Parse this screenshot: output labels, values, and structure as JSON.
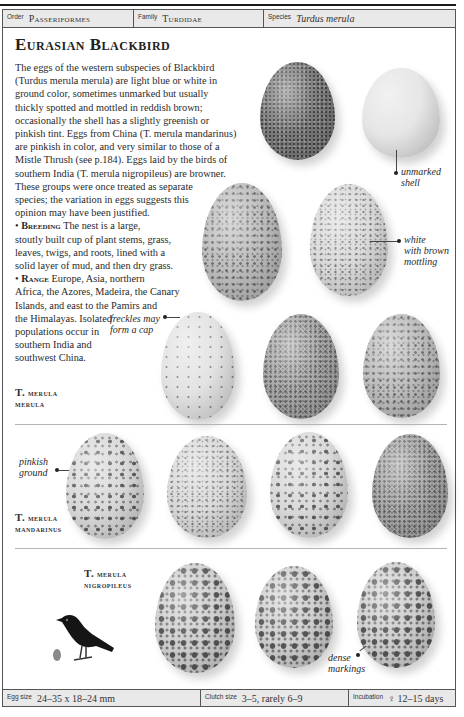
{
  "header": {
    "order_label": "Order",
    "order_value": "Passeriformes",
    "family_label": "Family",
    "family_value": "Turdidae",
    "species_label": "Species",
    "species_value": "Turdus merula"
  },
  "title": "Eurasian Blackbird",
  "description": {
    "lines": [
      "The eggs of the western subspecies of Blackbird",
      "(Turdus merula merula) are light blue or white in",
      "ground color, sometimes unmarked but usually",
      "thickly spotted and mottled in reddish brown;",
      "occasionally the shell has a slightly greenish or",
      "pinkish tint. Eggs from China (T. merula mandarinus)",
      "are pinkish in color, and very similar to those of a",
      "Mistle Thrush (see p.184). Eggs laid by the birds of",
      "southern India (T. merula nigropileus) are browner.",
      "These groups were once treated as separate",
      "species; the variation in eggs suggests this",
      "opinion may have been justified."
    ],
    "breeding_heading": "Breeding",
    "breeding_lines": [
      "The nest is a large,",
      "stoutly built cup of plant stems, grass,",
      "leaves, twigs, and roots, lined with a",
      "solid layer of mud, and then dry grass."
    ],
    "range_heading": "Range",
    "range_lines": [
      "Europe, Asia, northern",
      "Africa, the Azores, Madeira, the Canary",
      "Islands, and east to the Pamirs and",
      "the Himalayas. Isolated",
      "populations occur in",
      "southern India and",
      "southwest China."
    ]
  },
  "callouts": {
    "unmarked_line1": "unmarked",
    "unmarked_line2": "shell",
    "white_line1": "white",
    "white_line2": "with brown",
    "white_line3": "mottling",
    "freckles_line1": "freckles may",
    "freckles_line2": "form a cap",
    "pinkish_line1": "pinkish",
    "pinkish_line2": "ground",
    "dense_line1": "dense",
    "dense_line2": "markings"
  },
  "subspecies": [
    {
      "line1_cap": "T.",
      "line1": "merula",
      "line2": "merula"
    },
    {
      "line1_cap": "T.",
      "line1": "merula",
      "line2": "mandarinus"
    },
    {
      "line1_cap": "T.",
      "line1": "merula",
      "line2": "nigropileus"
    }
  ],
  "footer": {
    "egg_size_label": "Egg size",
    "egg_size_value": "24–35 x 18–24 mm",
    "clutch_size_label": "Clutch size",
    "clutch_size_value": "3–5, rarely 6–9",
    "incubation_label": "Incubation",
    "incubation_icon": "♀",
    "incubation_value": "12–15 days"
  }
}
